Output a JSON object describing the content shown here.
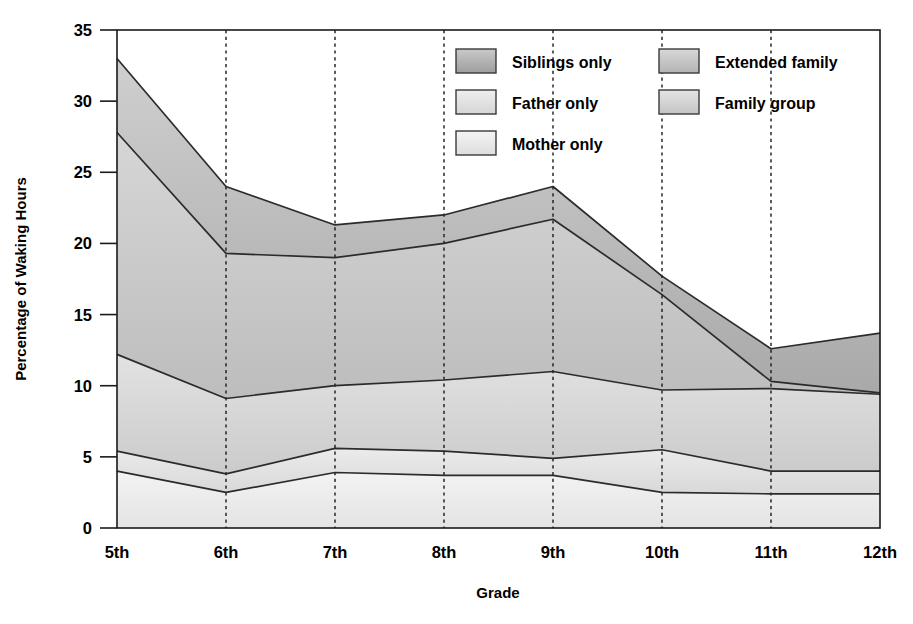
{
  "chart_data": {
    "type": "area",
    "stacked": true,
    "title": "",
    "subtitle": "",
    "xlabel": "Grade",
    "ylabel": "Percentage of Waking Hours",
    "categories": [
      "5th",
      "6th",
      "7th",
      "8th",
      "9th",
      "10th",
      "11th",
      "12th"
    ],
    "xlim": [
      0,
      7
    ],
    "ylim": [
      0,
      35
    ],
    "yticks": [
      0,
      5,
      10,
      15,
      20,
      25,
      30,
      35
    ],
    "ytick_labels": [
      "0",
      "5",
      "10",
      "15",
      "20",
      "25",
      "30",
      "35"
    ],
    "grid": "vertical-dashed",
    "legend_position": "top-right-inside",
    "series": [
      {
        "name": "Mother only",
        "color": "#ececec",
        "values": [
          4.0,
          2.5,
          3.9,
          3.7,
          3.7,
          2.5,
          2.4,
          2.4
        ]
      },
      {
        "name": "Father only",
        "color": "#e0e0e0",
        "values": [
          1.4,
          1.3,
          1.7,
          1.7,
          1.2,
          3.0,
          1.6,
          1.6
        ]
      },
      {
        "name": "Family group",
        "color": "#d4d4d4",
        "values": [
          6.8,
          5.3,
          4.4,
          5.0,
          6.1,
          4.2,
          5.8,
          5.4
        ]
      },
      {
        "name": "Extended family",
        "color": "#c3c3c3",
        "values": [
          15.6,
          10.2,
          9.0,
          9.6,
          10.7,
          6.7,
          0.5,
          0.1
        ]
      },
      {
        "name": "Siblings only",
        "color": "#b0b0b0",
        "values": [
          5.2,
          4.7,
          2.3,
          2.0,
          2.3,
          1.3,
          2.3,
          4.2
        ]
      }
    ],
    "cumulative_tops": {
      "mother_only": [
        4.0,
        2.5,
        3.9,
        3.7,
        3.7,
        2.5,
        2.4,
        2.4
      ],
      "father_only": [
        5.4,
        3.8,
        5.6,
        5.4,
        4.9,
        5.5,
        4.0,
        4.0
      ],
      "family_group": [
        12.2,
        9.1,
        10.0,
        10.4,
        11.0,
        9.7,
        9.8,
        9.4
      ],
      "extended_family": [
        27.8,
        19.3,
        19.0,
        20.0,
        21.7,
        16.4,
        10.3,
        9.5
      ],
      "siblings_only": [
        33.0,
        24.0,
        21.3,
        22.0,
        24.0,
        17.7,
        12.6,
        13.7
      ]
    },
    "annotations": []
  },
  "legend": {
    "items": [
      {
        "label": "Siblings only",
        "color": "#b0b0b0",
        "column": 1,
        "row": 1
      },
      {
        "label": "Father only",
        "color": "#e0e0e0",
        "column": 1,
        "row": 2
      },
      {
        "label": "Mother only",
        "color": "#ececec",
        "column": 1,
        "row": 3
      },
      {
        "label": "Extended family",
        "color": "#c3c3c3",
        "column": 2,
        "row": 1
      },
      {
        "label": "Family group",
        "color": "#d4d4d4",
        "column": 2,
        "row": 2
      }
    ]
  },
  "axes": {
    "y_title": "Percentage of Waking Hours",
    "x_title": "Grade",
    "y_ticks": [
      "0",
      "5",
      "10",
      "15",
      "20",
      "25",
      "30",
      "35"
    ],
    "x_ticks": [
      "5th",
      "6th",
      "7th",
      "8th",
      "9th",
      "10th",
      "11th",
      "12th"
    ]
  }
}
